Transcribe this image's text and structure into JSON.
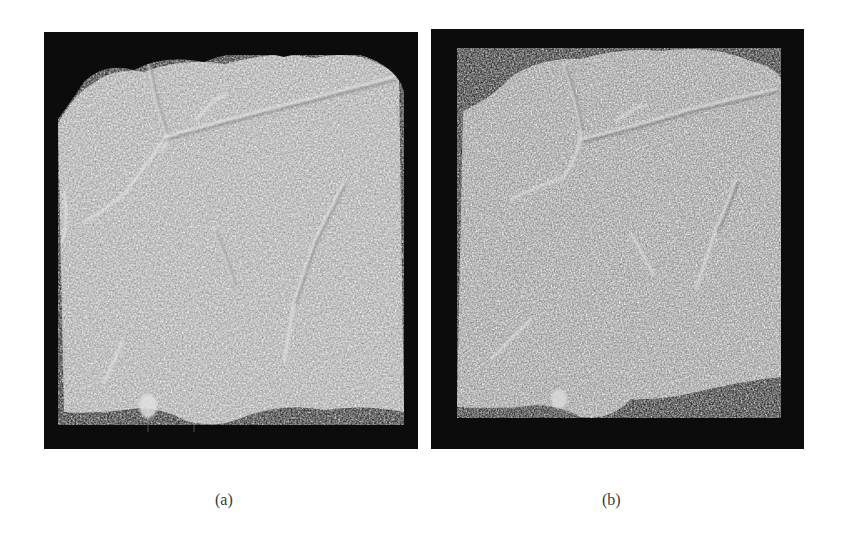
{
  "figure": {
    "panels": [
      {
        "id": "a",
        "caption": "(a)",
        "description": "Grayscale 3D rendering of textured specimen block with cracks, dark background",
        "background_color": "#0c0c0c",
        "specimen_color": "#b4b4b4"
      },
      {
        "id": "b",
        "caption": "(b)",
        "description": "Grayscale 3D rendering of textured specimen block with cracks, slightly rotated view, dark background",
        "background_color": "#0c0c0c",
        "specimen_color": "#a8a8a8"
      }
    ]
  }
}
